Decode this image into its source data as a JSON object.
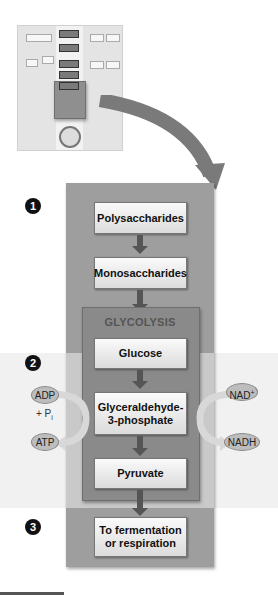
{
  "diagram": {
    "steps": {
      "s1": "1",
      "s2": "2",
      "s3": "3"
    },
    "boxes": {
      "polysaccharides": "Polysaccharides",
      "monosaccharides": "Monosaccharides",
      "glucose": "Glucose",
      "g3p_line1": "Glyceraldehyde-",
      "g3p_line2": "3-phosphate",
      "pyruvate": "Pyruvate",
      "fate_line1": "To fermentation",
      "fate_line2": "or respiration"
    },
    "glycolysis_label": "GLYCOLYSIS",
    "left_cycle": {
      "input": "ADP",
      "cofactor": "+ P",
      "cofactor_sub": "i",
      "output": "ATP"
    },
    "right_cycle": {
      "input": "NAD",
      "input_sup": "+",
      "output": "NADH"
    },
    "colors": {
      "dark_band": "#9e9e9e",
      "light_band": "#c9c9c9",
      "glycolysis_box": "#8a8a8a",
      "arrow": "#555555"
    }
  }
}
